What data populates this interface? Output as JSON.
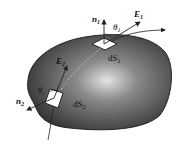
{
  "diagram": {
    "labels": {
      "n1": "n",
      "n1_sub": "1",
      "n2": "n",
      "n2_sub": "2",
      "E1": "E",
      "E1_sub": "1",
      "E2": "E",
      "E2_sub": "2",
      "theta1": "θ",
      "theta1_sub": "1",
      "theta2": "θ",
      "theta2_sub": "2",
      "dS1": "dS",
      "dS1_sub": "1",
      "dS2": "dS",
      "dS2_sub": "2"
    },
    "colors": {
      "surface_dark": "#3a3a3a",
      "surface_light": "#d8d8d8",
      "stroke": "#222222",
      "background": "#ffffff"
    }
  }
}
